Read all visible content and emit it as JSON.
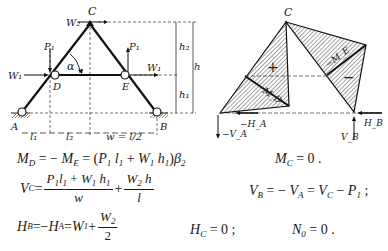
{
  "figure_left": {
    "title": "Three-hinged frame with tie D–E",
    "labels": {
      "apex": "C",
      "left_support": "A",
      "right_support": "B",
      "left_joint": "D",
      "right_joint": "E",
      "angle": "α",
      "apex_load": "W₂",
      "left_vertical_load": "P₁",
      "right_vertical_load": "P₁",
      "left_horizontal_load": "W₁",
      "right_horizontal_load": "W₁",
      "height_upper": "h₂",
      "height_lower": "h₁",
      "height_total": "h",
      "span_1": "l₁",
      "span_2": "l₂",
      "span_w": "w = l/2"
    }
  },
  "figure_right": {
    "title": "Moment diagram",
    "labels": {
      "apex": "C",
      "plus_sign": "+",
      "minus_sign": "−",
      "moment_D": "M_D",
      "moment_E": "−M_E",
      "reaction_HA": "−H_A",
      "reaction_VA": "−V_A",
      "reaction_HB": "H_B",
      "reaction_VB": "V_B"
    }
  },
  "equations": [
    {
      "id": "eq-md",
      "text": "M_D = − M_E = (P₁ l₁ + W₁ h₁) β₂"
    },
    {
      "id": "eq-mc",
      "text": "M_C = 0 ."
    },
    {
      "id": "eq-vc",
      "text": "V_C = (P₁ l₁ + W₁ h₁)/w + W₂ h / l"
    },
    {
      "id": "eq-vb",
      "text": "V_B = − V_A = V_C − P₁ ;"
    },
    {
      "id": "eq-hb",
      "text": "H_B = − H_A = W₁ + W₂/2"
    },
    {
      "id": "eq-hc",
      "text": "H_C = 0 ;"
    },
    {
      "id": "eq-n0",
      "text": "N₀ = 0 ."
    }
  ],
  "eq_parts": {
    "M": "M",
    "V": "V",
    "H": "H",
    "N": "N",
    "P": "P",
    "W": "W",
    "l": "l",
    "h": "h",
    "w": "w",
    "beta": "β",
    "sub_D": "D",
    "sub_E": "E",
    "sub_C": "C",
    "sub_B": "B",
    "sub_A": "A",
    "sub_0": "0",
    "sub_1": "1",
    "sub_2": "2",
    "eq_sign": " = ",
    "minus": " − ",
    "plus": " + ",
    "two": "2",
    "zero_dot": "0 .",
    "zero_semi": "0 ;",
    "semi": " ;",
    "lparen": "(",
    "rparen": ")"
  }
}
